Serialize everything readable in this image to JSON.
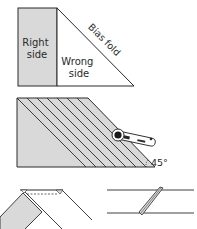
{
  "panel1": {
    "right_side_label": [
      "Right",
      "side"
    ],
    "wrong_side_label": [
      "Wrong",
      "side"
    ],
    "fold_label": "Bias fold",
    "fabric_color": "#d9d9d9",
    "line_color": "#2a2a2a"
  },
  "panel2": {
    "angle_label": "45°",
    "stripe_count": 8,
    "tool": "rotary-cutter"
  },
  "panel3": {
    "left": "strips-joined-at-right-angle",
    "right": "diagonal-seam-joined-strip"
  }
}
